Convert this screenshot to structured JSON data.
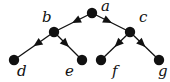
{
  "diagram": {
    "type": "binary-tree",
    "colors": {
      "node": "#111111",
      "edge": "#111111",
      "background": "#ffffff"
    },
    "nodes": [
      {
        "id": "a",
        "label": "a",
        "x": 92,
        "y": 13,
        "lx": 101,
        "ly": 11
      },
      {
        "id": "b",
        "label": "b",
        "x": 54,
        "y": 32,
        "lx": 42,
        "ly": 22
      },
      {
        "id": "c",
        "label": "c",
        "x": 130,
        "y": 32,
        "lx": 139,
        "ly": 22
      },
      {
        "id": "d",
        "label": "d",
        "x": 14,
        "y": 60,
        "lx": 17,
        "ly": 76
      },
      {
        "id": "e",
        "label": "e",
        "x": 82,
        "y": 60,
        "lx": 65,
        "ly": 76
      },
      {
        "id": "f",
        "label": "f",
        "x": 101,
        "y": 60,
        "lx": 112,
        "ly": 76
      },
      {
        "id": "g",
        "label": "g",
        "x": 159,
        "y": 60,
        "lx": 158,
        "ly": 76
      }
    ],
    "edges": [
      {
        "from": "a",
        "to": "b"
      },
      {
        "from": "a",
        "to": "c"
      },
      {
        "from": "b",
        "to": "d"
      },
      {
        "from": "b",
        "to": "e"
      },
      {
        "from": "c",
        "to": "f"
      },
      {
        "from": "c",
        "to": "g"
      }
    ]
  }
}
